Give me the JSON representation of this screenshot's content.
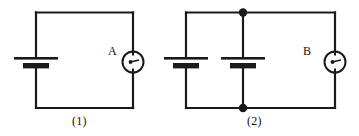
{
  "figure": {
    "title": "",
    "background_color": "#ffffff",
    "line_color": "#1a1a1a",
    "width": 359,
    "height": 136
  },
  "circuits": [
    {
      "caption": "(1)",
      "meter_label": "A",
      "meter_type": "ammeter",
      "cells": 1,
      "junction_dots": 0,
      "description": "single cell in series with meter A"
    },
    {
      "caption": "(2)",
      "meter_label": "B",
      "meter_type": "ammeter",
      "cells": 2,
      "junction_dots": 2,
      "description": "two cells in parallel in series with meter B"
    }
  ],
  "symbols": {
    "battery_name": "battery-cell",
    "meter_name": "meter-gauge",
    "junction_name": "junction-dot",
    "wire_name": "wire"
  }
}
